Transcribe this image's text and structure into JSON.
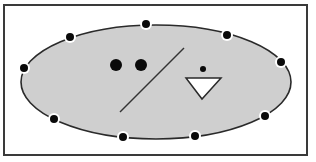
{
  "colors": {
    "background": "#ffffff",
    "frame_stroke": "#3a3a3a",
    "region_fill": "#cfcfcf",
    "region_stroke": "#2a2a2a",
    "dot_fill": "#0a0a0a",
    "dot_halo": "#ffffff",
    "triangle_fill": "#ffffff",
    "line_stroke": "#333333"
  },
  "frame": {
    "x": 4,
    "y": 5,
    "width": 303,
    "height": 150
  },
  "region": {
    "cx": 156,
    "cy": 82,
    "rx": 135,
    "ry": 57
  },
  "boundary_points": [
    {
      "x": 24,
      "y": 68
    },
    {
      "x": 70,
      "y": 37
    },
    {
      "x": 146,
      "y": 24
    },
    {
      "x": 227,
      "y": 35
    },
    {
      "x": 281,
      "y": 62
    },
    {
      "x": 265,
      "y": 116
    },
    {
      "x": 195,
      "y": 136
    },
    {
      "x": 123,
      "y": 137
    },
    {
      "x": 54,
      "y": 119
    }
  ],
  "interior": {
    "large_dots": [
      {
        "x": 116,
        "y": 65,
        "r": 6
      },
      {
        "x": 141,
        "y": 65,
        "r": 6
      }
    ],
    "line": {
      "x1": 184,
      "y1": 48,
      "x2": 120,
      "y2": 112
    },
    "small_dot": {
      "x": 203,
      "y": 69,
      "r": 3
    },
    "triangle": {
      "points": "186,78 221,78 202,99"
    }
  }
}
